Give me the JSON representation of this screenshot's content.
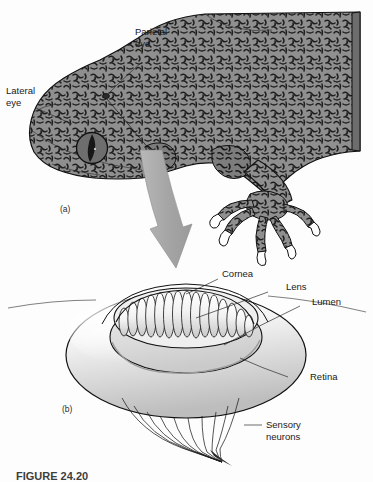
{
  "figure": {
    "caption": "FIGURE 24.20",
    "background_color": "#fdfdfd",
    "ink_color": "#111111",
    "skin_color": "#8a8a8a",
    "skin_shadow_color": "#6f6f6f",
    "arrow_color": "#a8a8a8",
    "eye_color": "#6a6a6a",
    "pupil_color": "#1b1b1b"
  },
  "panels": [
    {
      "id": "a",
      "label": "(a)",
      "subject": "gecko-head-lateral-view"
    },
    {
      "id": "b",
      "label": "(b)",
      "subject": "parietal-eye-cutaway"
    }
  ],
  "labels_panel_a": [
    {
      "name": "parietal-eye",
      "text_line1": "Parietal",
      "text_line2": "eye"
    },
    {
      "name": "lateral-eye",
      "text_line1": "Lateral",
      "text_line2": "eye"
    }
  ],
  "labels_panel_b": [
    {
      "name": "cornea",
      "text": "Cornea"
    },
    {
      "name": "lens",
      "text": "Lens"
    },
    {
      "name": "lumen",
      "text": "Lumen"
    },
    {
      "name": "retina",
      "text": "Retina"
    },
    {
      "name": "sensory-neurons",
      "text_line1": "Sensory",
      "text_line2": "neurons"
    }
  ]
}
